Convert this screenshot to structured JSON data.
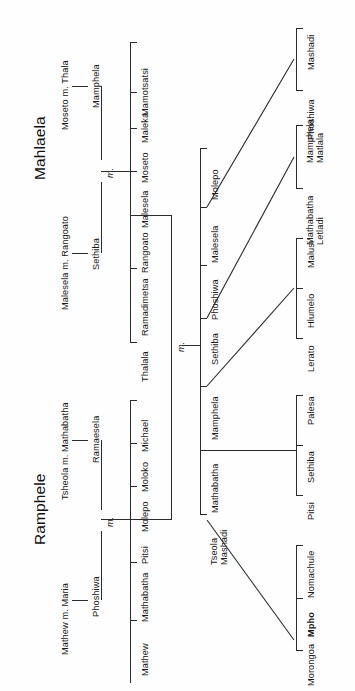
{
  "figure": {
    "kind": "genealogy-chart",
    "orientation": "rotated-90",
    "background": "#fefefe",
    "line_color": "#2b2b2b"
  },
  "families": [
    {
      "id": "mahlaela",
      "title": "Mahlaela",
      "couples": [
        {
          "id": "mahlaela-couple-a",
          "label": "Malesela m. Rangoato",
          "child": "Sethiba"
        },
        {
          "id": "mahlaela-couple-b",
          "label": "Moseto m. Thala",
          "child": "Mamphela"
        }
      ],
      "union_marker": "m.",
      "children": [
        "Thalala",
        "Ramadimetsa",
        "Rangoato",
        "Malesela",
        "Moseto",
        "Maleka",
        "Mamotsatsi"
      ]
    },
    {
      "id": "ramphele",
      "title": "Ramphele",
      "couples": [
        {
          "id": "ramphele-couple-a",
          "label": "Mathew m. Maria",
          "child": "Phoshiwa"
        },
        {
          "id": "ramphele-couple-b",
          "label": "Tsheola m. Mathabatha",
          "child": "Ramaesela"
        }
      ],
      "union_marker": "m.",
      "children": [
        "Mathew",
        "Mathabatha",
        "Pitsi",
        "Molepo",
        "Moloko",
        "Michael"
      ]
    }
  ],
  "central_union": {
    "marker": "m."
  },
  "central_children": [
    "Molepo",
    "Malesela",
    "Phoshiwa",
    "Sethiba",
    "Mamphela",
    "Mathabatha",
    "Tseola\nMashadi"
  ],
  "grandchild_groups": [
    {
      "id": "group-mashadi",
      "parent": "Malesela",
      "members": [
        "Phoshiwa",
        "Mashadi"
      ]
    },
    {
      "id": "group-letladi",
      "parent": "Sethiba",
      "members": [
        "Mathabatha\nLetladi",
        "Mamphela\nMatlala"
      ]
    },
    {
      "id": "group-malusi",
      "parent": "Mamphela",
      "members": [
        "Lerato",
        "Hlumelo",
        "Malusi"
      ]
    },
    {
      "id": "group-palesa",
      "parent": "Mathabatha",
      "members": [
        "Pitsi",
        "Sethiba",
        "Palesa"
      ]
    },
    {
      "id": "group-morongoa",
      "parent": "Tseola Mashadi",
      "members": [
        "Morongoa",
        "Mpho",
        "Nomachule"
      ]
    }
  ]
}
